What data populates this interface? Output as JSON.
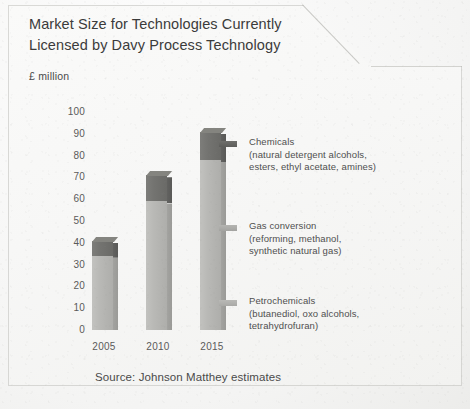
{
  "document": {
    "title_line1": "Market Size for Technologies Currently",
    "title_line2": "Licensed by Davy Process Technology",
    "units": "£ million",
    "source": "Source: Johnson Matthey estimates"
  },
  "colors": {
    "chemicals": "#6f6f6c",
    "gas_conversion": "#b4b4b1",
    "petrochemicals": "#b9b9b6",
    "paper": "#f7f7f6",
    "text": "#4a4a4a"
  },
  "legend": {
    "position": "right",
    "items": [
      {
        "label": "Chemicals",
        "detail_line1": "(natural detergent alcohols,",
        "detail_line2": "esters, ethyl acetate, amines)",
        "swatch": "dark",
        "swatch_name": "chemicals-swatch"
      },
      {
        "label": "Gas conversion",
        "detail_line1": "(reforming, methanol,",
        "detail_line2": "synthetic natural gas)",
        "swatch": "mid",
        "swatch_name": "gas-conversion-swatch"
      },
      {
        "label": "Petrochemicals",
        "detail_line1": "(butanediol, oxo alcohols,",
        "detail_line2": "tetrahydrofuran)",
        "swatch": "light",
        "swatch_name": "petrochemicals-swatch"
      }
    ]
  },
  "chart_data": {
    "type": "bar",
    "stacked": true,
    "title": "Market Size for Technologies Currently Licensed by Davy Process Technology",
    "subtitle": "£ million",
    "xlabel": "",
    "ylabel": "£ million",
    "ylim": [
      0,
      100
    ],
    "yticks": [
      0,
      10,
      20,
      30,
      40,
      50,
      60,
      70,
      80,
      90,
      100
    ],
    "ytick_labels": [
      "0",
      "10",
      "20",
      "30",
      "40",
      "50",
      "60",
      "70",
      "80",
      "90",
      "100"
    ],
    "grid": false,
    "categories": [
      "2005",
      "2010",
      "2015"
    ],
    "series": [
      {
        "name": "Petrochemicals and gas conversion",
        "values": [
          34,
          59,
          78
        ],
        "color": "#b9b9b6"
      },
      {
        "name": "Chemicals",
        "values": [
          7,
          12,
          13
        ],
        "color": "#6f6f6c"
      }
    ],
    "totals": [
      41,
      71,
      91
    ],
    "annotations": [
      "Source: Johnson Matthey estimates"
    ]
  }
}
